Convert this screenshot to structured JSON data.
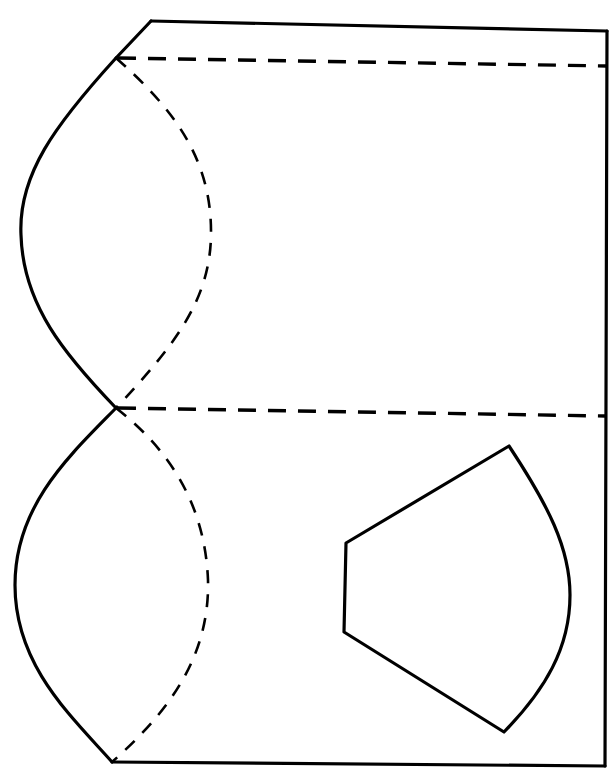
{
  "diagram": {
    "type": "paper-craft-net",
    "width": 613,
    "height": 777,
    "colors": {
      "background": "#ffffff",
      "stroke": "#000000"
    },
    "outline": {
      "top_edge": "M151,21 L607,31",
      "right_edge": "M607,31 L605,766",
      "bottom_edge": "M112,762 L605,766",
      "top_slant": "M151,21 L116,58",
      "upper_lobe": "M116,58 C55,125 18,175 21,235 C23,305 65,355 116,408",
      "lower_lobe": "M116,408 C70,455 15,505 15,585 C15,665 70,715 112,762"
    },
    "fold_lines": {
      "upper_horizontal": "M118,58 L607,66",
      "lower_horizontal": "M118,408 L605,416",
      "upper_curve": "M116,58 C175,110 212,160 211,235 C210,300 175,345 116,408",
      "lower_curve": "M116,408 C170,450 205,505 208,580 C210,660 165,715 112,762"
    },
    "cutout": {
      "path": "M346,543 L509,446 C548,505 570,548 570,595 C570,648 545,690 504,732 L344,632 Z"
    }
  }
}
